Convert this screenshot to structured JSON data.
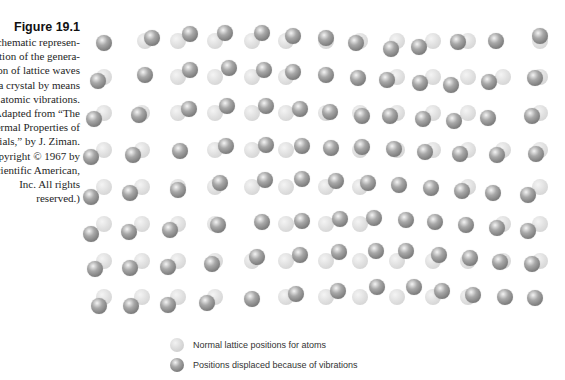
{
  "caption": {
    "title": "Figure 19.1",
    "lines": [
      "Schematic represen-",
      "tation of the genera-",
      "tion of lattice waves",
      "in a crystal by means",
      "of atomic vibrations.",
      "(Adapted from “The",
      "Thermal Properties of",
      "Materials,” by J. Ziman.",
      "Copyright © 1967 by",
      "Scientific American,",
      "Inc. All rights",
      "reserved.)"
    ]
  },
  "legend": {
    "normal_label": "Normal lattice positions for atoms",
    "displaced_label": "Positions displaced because of vibrations"
  },
  "lattice": {
    "rows": [
      {
        "y": 41,
        "normal": [
          104,
          145,
          178,
          215,
          252,
          286,
          326,
          360,
          397,
          433,
          468,
          503,
          540
        ],
        "displaced": [
          [
            104,
            43
          ],
          [
            152,
            38
          ],
          [
            190,
            34
          ],
          [
            225,
            33
          ],
          [
            262,
            33
          ],
          [
            293,
            36
          ],
          [
            326,
            38
          ],
          [
            356,
            43
          ],
          [
            391,
            49
          ],
          [
            419,
            47
          ],
          [
            458,
            42
          ],
          [
            496,
            41
          ],
          [
            540,
            36
          ]
        ]
      },
      {
        "y": 77,
        "normal": [
          104,
          142,
          178,
          215,
          252,
          286,
          326,
          360,
          397,
          433,
          468,
          503,
          540
        ],
        "displaced": [
          [
            98,
            81
          ],
          [
            145,
            75
          ],
          [
            190,
            70
          ],
          [
            229,
            68
          ],
          [
            264,
            70
          ],
          [
            293,
            72
          ],
          [
            326,
            75
          ],
          [
            358,
            78
          ],
          [
            387,
            80
          ],
          [
            420,
            83
          ],
          [
            451,
            85
          ],
          [
            489,
            82
          ],
          [
            535,
            78
          ]
        ]
      },
      {
        "y": 113,
        "normal": [
          104,
          142,
          178,
          215,
          252,
          286,
          326,
          360,
          397,
          433,
          468,
          503,
          540
        ],
        "displaced": [
          [
            94,
            119
          ],
          [
            139,
            115
          ],
          [
            189,
            109
          ],
          [
            227,
            106
          ],
          [
            266,
            106
          ],
          [
            300,
            109
          ],
          [
            330,
            112
          ],
          [
            362,
            116
          ],
          [
            390,
            116
          ],
          [
            423,
            119
          ],
          [
            454,
            121
          ],
          [
            488,
            118
          ],
          [
            532,
            116
          ]
        ]
      },
      {
        "y": 150,
        "normal": [
          104,
          142,
          178,
          215,
          252,
          286,
          326,
          360,
          397,
          433,
          468,
          503,
          540
        ],
        "displaced": [
          [
            91,
            157
          ],
          [
            133,
            155
          ],
          [
            180,
            151
          ],
          [
            226,
            146
          ],
          [
            266,
            145
          ],
          [
            302,
            146
          ],
          [
            331,
            148
          ],
          [
            362,
            147
          ],
          [
            394,
            149
          ],
          [
            425,
            152
          ],
          [
            460,
            154
          ],
          [
            497,
            155
          ],
          [
            536,
            154
          ]
        ]
      },
      {
        "y": 187,
        "normal": [
          104,
          142,
          178,
          215,
          252,
          286,
          326,
          360,
          397,
          433,
          468,
          503,
          540
        ],
        "displaced": [
          [
            91,
            197
          ],
          [
            130,
            193
          ],
          [
            178,
            190
          ],
          [
            220,
            183
          ],
          [
            265,
            180
          ],
          [
            302,
            179
          ],
          [
            336,
            181
          ],
          [
            368,
            183
          ],
          [
            399,
            185
          ],
          [
            431,
            188
          ],
          [
            462,
            191
          ],
          [
            493,
            193
          ],
          [
            528,
            195
          ]
        ]
      },
      {
        "y": 224,
        "normal": [
          104,
          142,
          178,
          215,
          252,
          286,
          326,
          360,
          397,
          433,
          468,
          503,
          540
        ],
        "displaced": [
          [
            91,
            234
          ],
          [
            129,
            232
          ],
          [
            170,
            230
          ],
          [
            218,
            225
          ],
          [
            262,
            222
          ],
          [
            302,
            221
          ],
          [
            340,
            219
          ],
          [
            374,
            218
          ],
          [
            406,
            220
          ],
          [
            435,
            222
          ],
          [
            466,
            225
          ],
          [
            497,
            228
          ],
          [
            528,
            231
          ]
        ]
      },
      {
        "y": 261,
        "normal": [
          104,
          142,
          178,
          215,
          252,
          286,
          326,
          360,
          397,
          433,
          468,
          503,
          540
        ],
        "displaced": [
          [
            95,
            269
          ],
          [
            130,
            268
          ],
          [
            168,
            267
          ],
          [
            212,
            264
          ],
          [
            257,
            257
          ],
          [
            300,
            255
          ],
          [
            339,
            252
          ],
          [
            376,
            251
          ],
          [
            406,
            251
          ],
          [
            439,
            255
          ],
          [
            470,
            258
          ],
          [
            500,
            262
          ],
          [
            532,
            264
          ]
        ]
      },
      {
        "y": 297,
        "normal": [
          104,
          142,
          178,
          215,
          252,
          286,
          326,
          360,
          397,
          433,
          468,
          503,
          540
        ],
        "displaced": [
          [
            99,
            306
          ],
          [
            131,
            306
          ],
          [
            168,
            305
          ],
          [
            207,
            303
          ],
          [
            252,
            299
          ],
          [
            296,
            294
          ],
          [
            338,
            291
          ],
          [
            377,
            287
          ],
          [
            414,
            287
          ],
          [
            442,
            291
          ],
          [
            473,
            295
          ],
          [
            505,
            297
          ],
          [
            535,
            298
          ]
        ]
      }
    ],
    "hidden_normals": [
      [
        0,
        0
      ],
      [
        1,
        1
      ],
      [
        3,
        6
      ],
      [
        5,
        8
      ],
      [
        0,
        11
      ],
      [
        2,
        11
      ],
      [
        4,
        11
      ],
      [
        5,
        4
      ],
      [
        4,
        9
      ],
      [
        7,
        12
      ]
    ]
  }
}
